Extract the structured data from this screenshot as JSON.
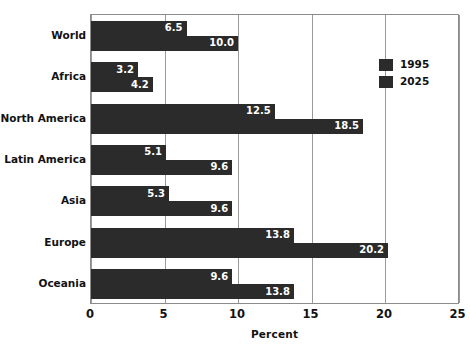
{
  "chart_data": {
    "type": "bar",
    "orientation": "horizontal",
    "title": "",
    "subtitle": "",
    "xlabel": "Percent",
    "ylabel": "",
    "xlim": [
      0,
      25.1
    ],
    "xticks": [
      0,
      5,
      10,
      15,
      20,
      25
    ],
    "xtick_labels": [
      "0",
      "5",
      "10",
      "15",
      "20",
      "25"
    ],
    "grid": "vertical",
    "legend_position": "upper-right-inside",
    "categories": [
      "World",
      "Africa",
      "North America",
      "Latin America",
      "Asia",
      "Europe",
      "Oceania"
    ],
    "series": [
      {
        "name": "1995",
        "color": "#2b2b2b",
        "values": [
          6.5,
          3.2,
          12.5,
          5.1,
          5.3,
          13.8,
          9.6
        ],
        "value_labels": [
          "6.5",
          "3.2",
          "12.5",
          "5.1",
          "5.3",
          "13.8",
          "9.6"
        ]
      },
      {
        "name": "2025",
        "color": "#2b2b2b",
        "values": [
          10.0,
          4.2,
          18.5,
          9.6,
          9.6,
          20.2,
          13.8
        ],
        "value_labels": [
          "10.0",
          "4.2",
          "18.5",
          "9.6",
          "9.6",
          "20.2",
          "13.8"
        ]
      }
    ]
  },
  "legend": {
    "items": [
      {
        "label": "1995",
        "color": "#2b2b2b"
      },
      {
        "label": "2025",
        "color": "#2b2b2b"
      }
    ]
  },
  "axis": {
    "x_title": "Percent"
  },
  "colors": {
    "bar": "#2b2b2b",
    "grid": "#9a9a9a",
    "frame": "#8c8c8c",
    "text": "#111111",
    "value_text": "#ffffff",
    "background": "#ffffff"
  }
}
